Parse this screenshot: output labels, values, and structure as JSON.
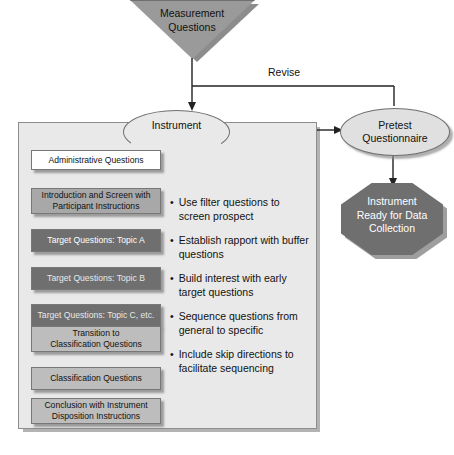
{
  "diagram": {
    "top_input": {
      "label": "Measurement\nQuestions",
      "line1": "Measurement",
      "line2": "Questions",
      "shape": "inverted-triangle",
      "fill": "#9a9a9a"
    },
    "process_node": {
      "line1": "Instrument",
      "line2": "Design",
      "shape": "ellipse",
      "fill": "#e9e9e9"
    },
    "pretest_node": {
      "line1": "Pretest",
      "line2": "Questionnaire",
      "shape": "ellipse",
      "fill": "#e0e0e0"
    },
    "terminal_node": {
      "line1": "Instrument",
      "line2": "Ready for Data",
      "line3": "Collection",
      "shape": "octagon",
      "fill": "#6f6f6f",
      "text_color": "#ffffff"
    },
    "feedback_arrow": {
      "label": "Revise"
    },
    "sequence_boxes": [
      {
        "label": "Administrative Questions",
        "lines": [
          "Administrative Questions"
        ],
        "fill": "#ffffff",
        "text_color": "#111111",
        "top": 150,
        "height": 20
      },
      {
        "label": "Introduction and Screen with Participant Instructions",
        "lines": [
          "Introduction and Screen with",
          "Participant Instructions"
        ],
        "fill": "#a8a8a8",
        "text_color": "#111111",
        "top": 188,
        "height": 26
      },
      {
        "label": "Target Questions: Topic A",
        "lines": [
          "Target Questions: Topic A"
        ],
        "fill": "#6f6f6f",
        "text_color": "#ffffff",
        "top": 229,
        "height": 23
      },
      {
        "label": "Target Questions: Topic B",
        "lines": [
          "Target Questions: Topic B"
        ],
        "fill": "#6f6f6f",
        "text_color": "#e8e8e8",
        "top": 267,
        "height": 23
      },
      {
        "label": "Target Questions: Topic C, etc.",
        "lines": [
          "Target Questions: Topic C, etc."
        ],
        "fill": "#6f6f6f",
        "text_color": "#e8e8e8",
        "top": 304,
        "height": 23
      },
      {
        "label": "Transition to Classification Questions",
        "lines": [
          "Transition to",
          "Classification Questions"
        ],
        "fill": "#bdbdbd",
        "text_color": "#111111",
        "top": 326,
        "height": 26
      },
      {
        "label": "Classification Questions",
        "lines": [
          "Classification Questions"
        ],
        "fill": "#bdbdbd",
        "text_color": "#111111",
        "top": 367,
        "height": 23
      },
      {
        "label": "Conclusion with Instrument Disposition Instructions",
        "lines": [
          "Conclusion with Instrument",
          "Disposition Instructions"
        ],
        "fill": "#bdbdbd",
        "text_color": "#111111",
        "top": 398,
        "height": 26
      }
    ],
    "guidelines": [
      {
        "text": "Use filter questions to screen prospect"
      },
      {
        "text": "Establish rapport with buffer questions"
      },
      {
        "text": "Build interest with early target questions"
      },
      {
        "text": "Sequence questions from general to specific"
      },
      {
        "text": "Include skip directions to facilitate sequencing"
      }
    ],
    "bullet_glyph": "•"
  }
}
